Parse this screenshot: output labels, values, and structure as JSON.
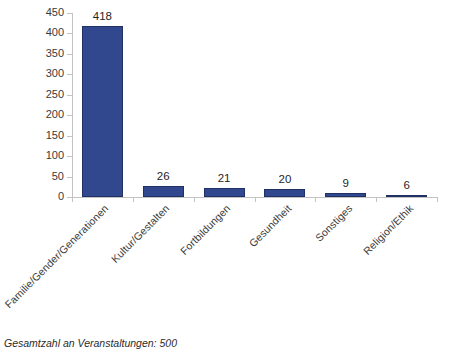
{
  "footer": {
    "caption": "Gesamtzahl an Veranstaltungen: 500"
  },
  "chart_data": {
    "type": "bar",
    "title": "",
    "subtitle": "",
    "xlabel": "",
    "ylabel": "",
    "categories": [
      "Familie/Gender/Generationen",
      "Kultur/Gestalten",
      "Fortbildungen",
      "Gesundheit",
      "Sonstiges",
      "Religion/Ethik"
    ],
    "values": [
      418,
      26,
      21,
      20,
      9,
      6
    ],
    "data_labels": [
      "418",
      "26",
      "21",
      "20",
      "9",
      "6"
    ],
    "ylim": [
      0,
      450
    ],
    "ytick_step": 50,
    "ytick_labels": [
      "450",
      "400",
      "350",
      "300",
      "250",
      "200",
      "150",
      "100",
      "50",
      "0"
    ],
    "ytick_values": [
      450,
      400,
      350,
      300,
      250,
      200,
      150,
      100,
      50,
      0
    ],
    "grid": false,
    "legend": false,
    "legend_position": "none",
    "annotation": "Gesamtzahl an Veranstaltungen: 500",
    "bar_color": "#31488f",
    "bar_border_color": "#1f3164",
    "axis_color": "#c3c3c3",
    "text_color": "#3a3a3a",
    "background": "#ffffff",
    "category_label_rotation": -45
  }
}
